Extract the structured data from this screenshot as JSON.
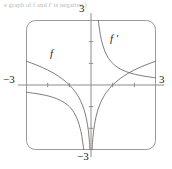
{
  "figure": {
    "caption_fragment": "e graph of f and f' is negative.)",
    "frame": {
      "stroke": "#9b9a99",
      "corner_radius": 9,
      "x": 26,
      "y": 20,
      "width": 130,
      "height": 130
    },
    "axes": {
      "stroke": "#8e8c8b",
      "x_axis_y_px": 84,
      "y_axis_x_px": 88,
      "tick_stroke": "#8e8c8b"
    }
  },
  "labels": {
    "top": "3",
    "bottom": "−3",
    "left": "−3",
    "right": "3",
    "function": "f",
    "derivative": "f ′"
  },
  "chart_data": {
    "type": "line",
    "title": "",
    "subtitle": "",
    "xlabel": "",
    "ylabel": "",
    "xlim": [
      -3,
      3
    ],
    "ylim": [
      -3,
      3
    ],
    "grid": false,
    "legend": "inline-curve-labels",
    "xticks": [
      -3,
      -2,
      -1,
      0,
      1,
      2,
      3
    ],
    "xticklabels": [
      "−3",
      "",
      "",
      "",
      "",
      "",
      "3"
    ],
    "yticks": [
      -3,
      -2,
      -1,
      0,
      1,
      2,
      3
    ],
    "yticklabels": [
      "−3",
      "",
      "",
      "",
      "",
      "",
      "3"
    ],
    "annotations": [
      {
        "text": "f",
        "x": -1.95,
        "y": 1.45
      },
      {
        "text": "f ′",
        "x": 0.62,
        "y": 2.2
      }
    ],
    "series": [
      {
        "name": "f",
        "label": "f",
        "expression": "ln|x|",
        "color": "#6f6d6c",
        "branches": [
          {
            "domain": [
              -3,
              -0.0497
            ],
            "x": [
              -3.0,
              -2.75,
              -2.5,
              -2.25,
              -2.0,
              -1.75,
              -1.5,
              -1.25,
              -1.0,
              -0.85,
              -0.7,
              -0.55,
              -0.4,
              -0.3,
              -0.22,
              -0.16,
              -0.12,
              -0.09,
              -0.07,
              -0.0497
            ],
            "y": [
              1.099,
              1.012,
              0.916,
              0.811,
              0.693,
              0.56,
              0.405,
              0.223,
              0.0,
              -0.163,
              -0.357,
              -0.598,
              -0.916,
              -1.204,
              -1.514,
              -1.833,
              -2.12,
              -2.408,
              -2.659,
              -3.0
            ]
          },
          {
            "domain": [
              0.0497,
              3
            ],
            "x": [
              0.0497,
              0.07,
              0.09,
              0.12,
              0.16,
              0.22,
              0.3,
              0.4,
              0.55,
              0.7,
              0.85,
              1.0,
              1.25,
              1.5,
              1.75,
              2.0,
              2.25,
              2.5,
              2.75,
              3.0
            ],
            "y": [
              -3.0,
              -2.659,
              -2.408,
              -2.12,
              -1.833,
              -1.514,
              -1.204,
              -0.916,
              -0.598,
              -0.357,
              -0.163,
              0.0,
              0.223,
              0.405,
              0.56,
              0.693,
              0.811,
              0.916,
              1.012,
              1.099
            ]
          }
        ]
      },
      {
        "name": "fprime",
        "label": "f ′",
        "expression": "1/x",
        "color": "#6f6d6c",
        "branches": [
          {
            "domain": [
              -3,
              -0.3333
            ],
            "x": [
              -3.0,
              -2.6,
              -2.2,
              -1.9,
              -1.6,
              -1.35,
              -1.15,
              -1.0,
              -0.85,
              -0.72,
              -0.6,
              -0.5,
              -0.42,
              -0.3333
            ],
            "y": [
              -0.333,
              -0.385,
              -0.455,
              -0.526,
              -0.625,
              -0.741,
              -0.87,
              -1.0,
              -1.176,
              -1.389,
              -1.667,
              -2.0,
              -2.381,
              -3.0
            ]
          },
          {
            "domain": [
              0.3333,
              3
            ],
            "x": [
              0.3333,
              0.42,
              0.5,
              0.6,
              0.72,
              0.85,
              1.0,
              1.15,
              1.35,
              1.6,
              1.9,
              2.2,
              2.6,
              3.0
            ],
            "y": [
              3.0,
              2.381,
              2.0,
              1.667,
              1.389,
              1.176,
              1.0,
              0.87,
              0.741,
              0.625,
              0.526,
              0.455,
              0.385,
              0.333
            ]
          }
        ]
      }
    ]
  }
}
